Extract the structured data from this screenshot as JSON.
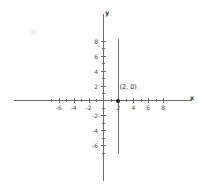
{
  "chart_data": {
    "type": "line",
    "title": "",
    "xlabel": "x",
    "ylabel": "y",
    "xlim": [
      -7.5,
      8.5
    ],
    "ylim": [
      -7.5,
      8.5
    ],
    "grid": false,
    "legend": false,
    "x_tick_labels": [
      "-6",
      "-4",
      "-2",
      "2",
      "4",
      "6",
      "8"
    ],
    "x_tick_values": [
      -6,
      -4,
      -2,
      2,
      4,
      6,
      8
    ],
    "y_tick_labels": [
      "8",
      "6",
      "4",
      "2",
      "-2",
      "-4",
      "-6"
    ],
    "y_tick_values": [
      8,
      6,
      4,
      2,
      -2,
      -4,
      -6
    ],
    "minor_tick_step": 1,
    "series": [
      {
        "name": "x = 2",
        "type": "vertical-line",
        "equation": "x = 2",
        "x": 2,
        "y_from": -7.2,
        "y_to": 8.3
      }
    ],
    "annotations": [
      {
        "label": "(2, 0)",
        "x": 2,
        "y": 0,
        "marker": "filled-circle"
      }
    ],
    "colors": {
      "axis": "#6b6b6b",
      "line": "#6f6f6f",
      "point": "#1a1a1a",
      "text": "#4a4a4a",
      "background": "#ffffff"
    }
  }
}
